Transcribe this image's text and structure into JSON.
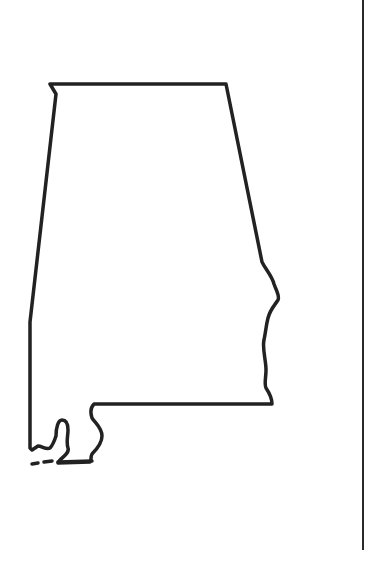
{
  "map": {
    "subject": "Alabama state outline",
    "stroke_color": "#222222",
    "background_color": "#ffffff",
    "border_line_color": "#2a2a2a"
  }
}
